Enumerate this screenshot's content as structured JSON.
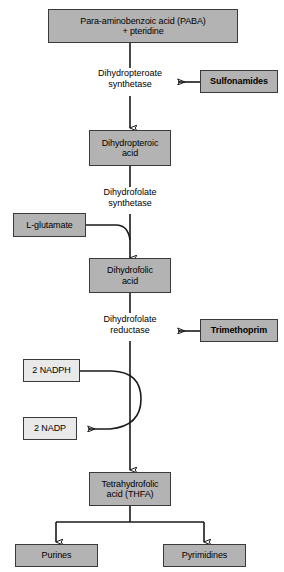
{
  "diagram": {
    "type": "flowchart",
    "colors": {
      "substrate_fill": "#b3b3b3",
      "cofactor_fill": "#e9e9e9",
      "box_border": "#3a3a3a",
      "arrow": "#1a1a1a",
      "background": "#ffffff"
    },
    "substrates": [
      {
        "id": "paba",
        "label": "Para-aminobenzoic acid (PABA)\n+ pteridine"
      },
      {
        "id": "dihydropteroic_acid",
        "label": "Dihydropteroic\nacid"
      },
      {
        "id": "dihydrofolic_acid",
        "label": "Dihydrofolic\nacid"
      },
      {
        "id": "thfa",
        "label": "Tetrahydrofolic\nacid (THFA)"
      },
      {
        "id": "purines",
        "label": "Purines"
      },
      {
        "id": "pyrimidines",
        "label": "Pyrimidines"
      }
    ],
    "enzymes": [
      {
        "id": "dihydropteroate_synthetase",
        "label": "Dihydropteroate\nsynthetase"
      },
      {
        "id": "dihydrofolate_synthetase",
        "label": "Dihydrofolate\nsynthetase"
      },
      {
        "id": "dihydrofolate_reductase",
        "label": "Dihydrofolate\nreductase"
      }
    ],
    "inhibitors": [
      {
        "id": "sulfonamides",
        "label": "Sulfonamides",
        "inhibits": "dihydropteroate_synthetase"
      },
      {
        "id": "trimethoprim",
        "label": "Trimethoprim",
        "inhibits": "dihydrofolate_reductase"
      }
    ],
    "cofactors": [
      {
        "id": "l_glutamate",
        "label": "L-glutamate",
        "style": "substrate_fill"
      },
      {
        "id": "nadph",
        "label": "2 NADPH",
        "style": "cofactor_fill"
      },
      {
        "id": "nadp",
        "label": "2 NADP",
        "style": "cofactor_fill"
      }
    ]
  }
}
